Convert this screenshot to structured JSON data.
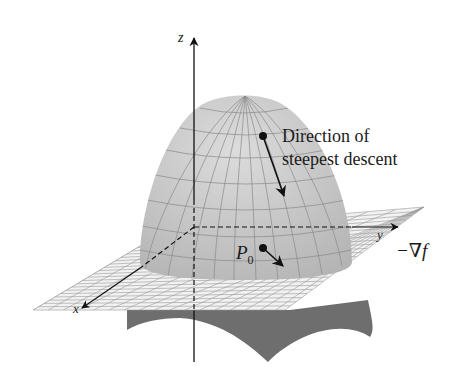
{
  "figure": {
    "axes": {
      "x_label": "x",
      "y_label": "y",
      "z_label": "z"
    },
    "annotations": {
      "direction_line1": "Direction of",
      "direction_line2": "steepest descent",
      "point_label": "P",
      "point_subscript": "0",
      "gradient_label": "−∇f"
    },
    "colors": {
      "surface": "#c8c8c8",
      "surface_grid": "#8a8a8a",
      "plane": "#f2f2f2",
      "plane_grid": "#9a9a9a",
      "underside": "#6e6e6e",
      "ink": "#111111"
    }
  }
}
